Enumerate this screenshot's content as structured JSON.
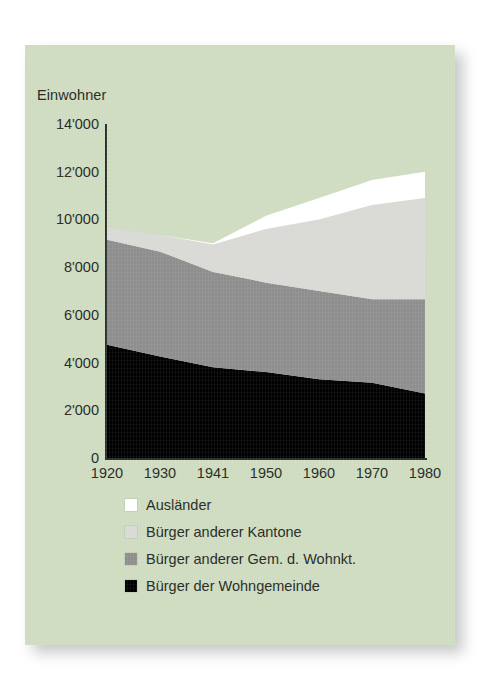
{
  "panel": {
    "background_color": "#cfdcc0"
  },
  "chart_data": {
    "type": "area",
    "stacked": true,
    "title": "",
    "ylabel": "Einwohner",
    "xlabel": "",
    "grid": false,
    "legend_position": "below",
    "ylim": [
      0,
      14000
    ],
    "yticks": [
      14000,
      12000,
      10000,
      8000,
      6000,
      4000,
      2000,
      0
    ],
    "ytick_labels": [
      "14'000",
      "12'000",
      "10'000",
      "8'000",
      "6'000",
      "4'000",
      "2'000",
      "0"
    ],
    "x": [
      1920,
      1930,
      1941,
      1950,
      1960,
      1970,
      1980
    ],
    "xtick_labels": [
      "1920",
      "1930",
      "1941",
      "1950",
      "1960",
      "1970",
      "1980"
    ],
    "series": [
      {
        "name": "Bürger der Wohngemeinde",
        "color": "#000000",
        "values": [
          4750,
          4250,
          3800,
          3600,
          3300,
          3150,
          2700
        ]
      },
      {
        "name": "Bürger anderer Gem. d. Wohnkt.",
        "color": "#8e8e8e",
        "values": [
          4400,
          4400,
          4000,
          3750,
          3700,
          3500,
          3950
        ]
      },
      {
        "name": "Bürger anderer Kantone",
        "color": "#d9d9d6",
        "values": [
          500,
          700,
          1150,
          2250,
          3000,
          3950,
          4250
        ]
      },
      {
        "name": "Ausländer",
        "color": "#ffffff",
        "values": [
          0,
          0,
          50,
          550,
          900,
          1050,
          1100
        ]
      }
    ],
    "totals": [
      9650,
      9350,
      9000,
      10150,
      10900,
      11650,
      12000
    ]
  },
  "legend": {
    "items": [
      {
        "label": "Ausländer",
        "color": "#ffffff"
      },
      {
        "label": "Bürger anderer Kantone",
        "color": "#d9d9d6"
      },
      {
        "label": "Bürger anderer Gem. d. Wohnkt.",
        "color": "#8e8e8e"
      },
      {
        "label": "Bürger der Wohngemeinde",
        "color": "#000000"
      }
    ]
  }
}
